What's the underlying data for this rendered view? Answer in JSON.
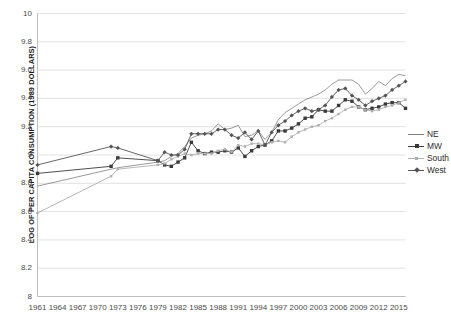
{
  "chart_data": {
    "type": "line",
    "title": "",
    "xlabel": "",
    "ylabel": "LOG OF PER CAPITA CONSUMPTION (1989 DOLLARS)",
    "ylim": [
      8,
      10
    ],
    "ytick_labels": [
      "10",
      "9.8",
      "9.6",
      "9.4",
      "9.2",
      "9",
      "8.8",
      "8.6",
      "8.4",
      "8.2",
      "8"
    ],
    "ytick_values": [
      10,
      9.8,
      9.6,
      9.4,
      9.2,
      9,
      8.8,
      8.6,
      8.4,
      8.2,
      8
    ],
    "xtick_labels": [
      "1961",
      "1964",
      "1967",
      "1970",
      "1973",
      "1976",
      "1979",
      "1982",
      "1985",
      "1988",
      "1991",
      "1994",
      "1997",
      "2000",
      "2003",
      "2006",
      "2009",
      "2012",
      "2015"
    ],
    "xlim": [
      1961,
      2016
    ],
    "grid": "horizontal",
    "legend_position": "right",
    "series": [
      {
        "name": "NE",
        "color": "#808080",
        "marker": "none",
        "x": [
          1961,
          1972,
          1973,
          1979,
          1980,
          1981,
          1982,
          1983,
          1984,
          1985,
          1986,
          1987,
          1988,
          1989,
          1990,
          1991,
          1992,
          1993,
          1994,
          1995,
          1996,
          1997,
          1998,
          1999,
          2000,
          2001,
          2002,
          2003,
          2004,
          2005,
          2006,
          2007,
          2008,
          2009,
          2010,
          2011,
          2012,
          2013,
          2014,
          2015,
          2016
        ],
        "y": [
          8.78,
          8.9,
          8.91,
          8.95,
          8.96,
          8.99,
          9.01,
          9.06,
          9.12,
          9.14,
          9.15,
          9.17,
          9.22,
          9.18,
          9.19,
          9.21,
          9.13,
          9.14,
          9.17,
          9.11,
          9.16,
          9.25,
          9.3,
          9.33,
          9.36,
          9.39,
          9.41,
          9.43,
          9.46,
          9.5,
          9.53,
          9.53,
          9.53,
          9.5,
          9.43,
          9.47,
          9.52,
          9.49,
          9.54,
          9.57,
          9.56
        ]
      },
      {
        "name": "MW",
        "color": "#3a3a3a",
        "marker": "square",
        "x": [
          1961,
          1972,
          1973,
          1979,
          1980,
          1981,
          1982,
          1983,
          1984,
          1985,
          1986,
          1987,
          1988,
          1989,
          1990,
          1991,
          1992,
          1993,
          1994,
          1995,
          1996,
          1997,
          1998,
          1999,
          2000,
          2001,
          2002,
          2003,
          2004,
          2005,
          2006,
          2007,
          2008,
          2009,
          2010,
          2011,
          2012,
          2013,
          2014,
          2015,
          2016
        ],
        "y": [
          8.87,
          8.92,
          8.98,
          8.96,
          8.93,
          8.92,
          8.95,
          8.98,
          9.09,
          9.03,
          9.01,
          9.02,
          9.02,
          9.03,
          9.02,
          9.05,
          8.99,
          9.03,
          9.06,
          9.07,
          9.1,
          9.17,
          9.17,
          9.19,
          9.22,
          9.26,
          9.27,
          9.32,
          9.31,
          9.31,
          9.35,
          9.39,
          9.38,
          9.34,
          9.32,
          9.33,
          9.34,
          9.36,
          9.37,
          9.37,
          9.33
        ]
      },
      {
        "name": "South",
        "color": "#b0b0b0",
        "marker": "smallsquare",
        "x": [
          1961,
          1972,
          1973,
          1979,
          1980,
          1981,
          1982,
          1983,
          1984,
          1985,
          1986,
          1987,
          1988,
          1989,
          1990,
          1991,
          1992,
          1993,
          1994,
          1995,
          1996,
          1997,
          1998,
          1999,
          2000,
          2001,
          2002,
          2003,
          2004,
          2005,
          2006,
          2007,
          2008,
          2009,
          2010,
          2011,
          2012,
          2013,
          2014,
          2015,
          2016
        ],
        "y": [
          8.59,
          8.85,
          8.9,
          8.93,
          8.94,
          8.97,
          8.99,
          9.01,
          9.0,
          9.01,
          9.01,
          9.01,
          9.03,
          9.04,
          9.02,
          9.07,
          9.06,
          9.08,
          9.08,
          9.07,
          9.09,
          9.1,
          9.09,
          9.13,
          9.16,
          9.18,
          9.2,
          9.21,
          9.24,
          9.26,
          9.29,
          9.32,
          9.34,
          9.34,
          9.32,
          9.31,
          9.32,
          9.34,
          9.35,
          9.37,
          9.39
        ]
      },
      {
        "name": "West",
        "color": "#555555",
        "marker": "diamond",
        "x": [
          1961,
          1972,
          1973,
          1979,
          1980,
          1981,
          1982,
          1983,
          1984,
          1985,
          1986,
          1987,
          1988,
          1989,
          1990,
          1991,
          1992,
          1993,
          1994,
          1995,
          1996,
          1997,
          1998,
          1999,
          2000,
          2001,
          2002,
          2003,
          2004,
          2005,
          2006,
          2007,
          2008,
          2009,
          2010,
          2011,
          2012,
          2013,
          2014,
          2015,
          2016
        ],
        "y": [
          8.93,
          9.06,
          9.05,
          8.96,
          9.02,
          9.0,
          9.0,
          9.04,
          9.15,
          9.15,
          9.15,
          9.15,
          9.18,
          9.18,
          9.14,
          9.12,
          9.16,
          9.11,
          9.17,
          9.07,
          9.16,
          9.21,
          9.24,
          9.28,
          9.31,
          9.33,
          9.31,
          9.32,
          9.35,
          9.41,
          9.46,
          9.47,
          9.42,
          9.39,
          9.35,
          9.38,
          9.4,
          9.42,
          9.46,
          9.49,
          9.52
        ]
      }
    ]
  },
  "legend": {
    "items": [
      {
        "label": "NE"
      },
      {
        "label": "MW"
      },
      {
        "label": "South"
      },
      {
        "label": "West"
      }
    ]
  }
}
